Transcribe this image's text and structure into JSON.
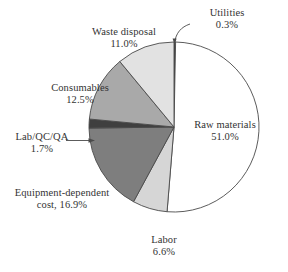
{
  "chart_data": {
    "type": "pie",
    "title": "",
    "unit": "%",
    "total": 100.0,
    "start_angle_deg": 0,
    "direction": "clockwise",
    "legend": "none",
    "grid": false,
    "categories": [
      "Utilities",
      "Raw materials",
      "Labor",
      "Equipment-dependent cost",
      "Lab/QC/QA",
      "Consumables",
      "Waste disposal"
    ],
    "values": [
      0.3,
      51.0,
      6.6,
      16.9,
      1.7,
      12.5,
      11.0
    ],
    "slices": [
      {
        "id": "utilities",
        "name": "Utilities",
        "value": 0.3,
        "value_label": "0.3%",
        "label_line1": "Utilities",
        "label_line2": "0.3%",
        "color": "#3a3a3a",
        "leader": "curved-line"
      },
      {
        "id": "raw-materials",
        "name": "Raw materials",
        "value": 51.0,
        "value_label": "51.0%",
        "label_line1": "Raw materials",
        "label_line2": "51.0%",
        "color": "#ffffff",
        "leader": "none"
      },
      {
        "id": "labor",
        "name": "Labor",
        "value": 6.6,
        "value_label": "6.6%",
        "label_line1": "Labor",
        "label_line2": "6.6%",
        "color": "#d6d6d6",
        "leader": "none"
      },
      {
        "id": "equipment-dependent-cost",
        "name": "Equipment-dependent cost",
        "value": 16.9,
        "value_label": "16.9%",
        "label_line1": "Equipment-dependent",
        "label_line2": "cost, 16.9%",
        "color": "#7e7e7e",
        "leader": "none"
      },
      {
        "id": "lab-qc-qa",
        "name": "Lab/QC/QA",
        "value": 1.7,
        "value_label": "1.7%",
        "label_line1": "Lab/QC/QA",
        "label_line2": "1.7%",
        "color": "#3f3f3f",
        "leader": "arrow"
      },
      {
        "id": "consumables",
        "name": "Consumables",
        "value": 12.5,
        "value_label": "12.5%",
        "label_line1": "Consumables",
        "label_line2": "12.5%",
        "color": "#a9a9a9",
        "leader": "none"
      },
      {
        "id": "waste-disposal",
        "name": "Waste disposal",
        "value": 11.0,
        "value_label": "11.0%",
        "label_line1": "Waste disposal",
        "label_line2": "11.0%",
        "color": "#e2e2e2",
        "leader": "none"
      }
    ],
    "geometry": {
      "center_x": 174,
      "center_y": 127,
      "radius": 85
    },
    "stroke_color": "#4a4a4a"
  }
}
